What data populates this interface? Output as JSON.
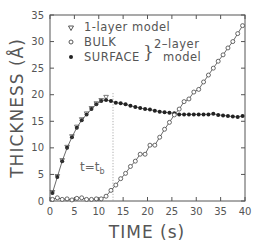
{
  "chart_data": {
    "type": "scatter",
    "title": "",
    "xlabel": "TIME (s)",
    "ylabel": "THICKNESS (Å)",
    "xlim": [
      0,
      40
    ],
    "ylim": [
      0,
      35
    ],
    "xticks": [
      0,
      5,
      10,
      15,
      20,
      25,
      30,
      35,
      40
    ],
    "yticks": [
      0,
      5,
      10,
      15,
      20,
      25,
      30,
      35
    ],
    "grid": false,
    "legend_position": "upper-left",
    "legend": [
      {
        "marker": "triangle-down-open",
        "label": "1-layer model"
      },
      {
        "marker": "circle-open",
        "label": "BULK"
      },
      {
        "marker": "circle-filled",
        "label": "SURFACE"
      }
    ],
    "legend_group_label": "2-layer model",
    "annotations": [
      {
        "text": "t=t_b",
        "type": "vertical-dotted-line",
        "x": 12.9
      }
    ],
    "series": [
      {
        "name": "SURFACE",
        "marker": "circle-filled",
        "line": true,
        "x": [
          0.5,
          1.5,
          2.5,
          3.5,
          4.5,
          5.5,
          6.5,
          7.5,
          8.5,
          9.5,
          10.5,
          11.5,
          12.5,
          13.5,
          14.5,
          15.5,
          16.5,
          17.5,
          18.5,
          19.5,
          20.5,
          21.5,
          22.5,
          23.5,
          24.5,
          25.5,
          26.5,
          27.5,
          28.5,
          29.5,
          30.5,
          31.5,
          32.5,
          33.5,
          34.5,
          35.5,
          36.5,
          37.5,
          38.5,
          39.5
        ],
        "y": [
          1.5,
          4.5,
          7.5,
          10.0,
          12.0,
          13.8,
          15.2,
          16.3,
          17.3,
          18.2,
          18.8,
          19.0,
          18.8,
          18.5,
          18.4,
          18.2,
          17.9,
          17.7,
          17.5,
          17.3,
          17.2,
          17.0,
          16.8,
          16.7,
          16.6,
          16.5,
          16.3,
          16.3,
          16.3,
          16.3,
          16.3,
          16.3,
          16.3,
          16.4,
          16.2,
          16.1,
          16.0,
          15.9,
          15.8,
          16.0
        ]
      },
      {
        "name": "BULK",
        "marker": "circle-open",
        "line": true,
        "x": [
          0.5,
          1.5,
          2.5,
          3.5,
          4.5,
          5.5,
          6.5,
          7.5,
          8.5,
          9.5,
          10.5,
          11.5,
          12.5,
          13.5,
          14.5,
          15.5,
          16.5,
          17.5,
          18.5,
          19.5,
          20.5,
          21.5,
          22.5,
          23.5,
          24.5,
          25.5,
          26.5,
          27.5,
          28.5,
          29.5,
          30.5,
          31.5,
          32.5,
          33.5,
          34.5,
          35.5,
          36.5,
          37.5,
          38.5,
          39.5
        ],
        "y": [
          0.3,
          0.6,
          0.3,
          0.4,
          0.2,
          0.5,
          0.6,
          0.3,
          0.3,
          0.4,
          0.4,
          0.9,
          2.0,
          3.0,
          4.2,
          5.2,
          6.5,
          7.5,
          8.8,
          8.8,
          10.5,
          10.5,
          12.0,
          13.5,
          14.8,
          16.2,
          17.3,
          18.7,
          19.2,
          20.5,
          21.0,
          22.4,
          23.7,
          25.0,
          26.3,
          27.5,
          28.8,
          30.0,
          31.5,
          33.0
        ]
      },
      {
        "name": "1-layer model",
        "marker": "triangle-down-open",
        "line": false,
        "x": [
          0.5,
          1.5,
          2.5,
          3.5,
          4.5,
          5.5,
          6.5,
          7.5,
          8.5,
          9.5,
          10.5,
          11.5
        ],
        "y": [
          1.6,
          4.6,
          7.6,
          10.1,
          12.1,
          13.9,
          15.3,
          16.4,
          17.4,
          18.3,
          18.9,
          19.5
        ]
      }
    ]
  }
}
